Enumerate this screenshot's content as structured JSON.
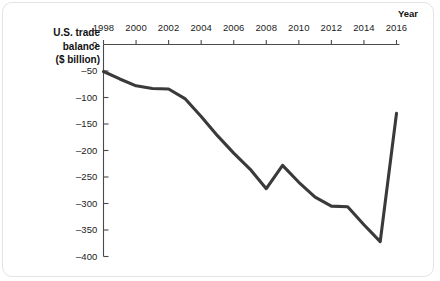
{
  "chart_data": {
    "type": "line",
    "title": "",
    "subtitle": "",
    "ylabel_lines": [
      "U.S. trade",
      "balance",
      "($ billion)"
    ],
    "ylabel": "U.S. trade balance ($ billion)",
    "xlabel": "Year",
    "x": [
      1998,
      1999,
      2000,
      2001,
      2002,
      2003,
      2004,
      2005,
      2006,
      2007,
      2008,
      2009,
      2010,
      2011,
      2012,
      2013,
      2014,
      2015,
      2016
    ],
    "values": [
      -51,
      -65,
      -78,
      -83,
      -84,
      -102,
      -136,
      -172,
      -205,
      -235,
      -272,
      -228,
      -260,
      -288,
      -305,
      -306,
      -340,
      -372,
      -130
    ],
    "xtick_labels": [
      "1998",
      "2000",
      "2002",
      "2004",
      "2006",
      "2008",
      "2010",
      "2012",
      "2014",
      "2016"
    ],
    "xtick_values": [
      1998,
      2000,
      2002,
      2004,
      2006,
      2008,
      2010,
      2012,
      2014,
      2016
    ],
    "ytick_labels": [
      "0",
      "–50",
      "–100",
      "–150",
      "–200",
      "–250",
      "–300",
      "–350",
      "–400"
    ],
    "ytick_values": [
      0,
      -50,
      -100,
      -150,
      -200,
      -250,
      -300,
      -350,
      -400
    ],
    "xlim": [
      1998,
      2016
    ],
    "ylim": [
      -400,
      0
    ],
    "grid": false,
    "legend": false,
    "legend_position": "none",
    "x_axis_position": "top",
    "series": [
      {
        "name": "U.S. trade balance",
        "color": "#3a3a3a",
        "values": [
          -51,
          -65,
          -78,
          -83,
          -84,
          -102,
          -136,
          -172,
          -205,
          -235,
          -272,
          -228,
          -260,
          -288,
          -305,
          -306,
          -340,
          -372,
          -130
        ]
      }
    ],
    "annotations": []
  },
  "colors": {
    "line": "#3a3a3a",
    "axis": "#4a4a4a",
    "text": "#1b1b1b",
    "background": "#ffffff",
    "frame": "#e3e3e3"
  }
}
